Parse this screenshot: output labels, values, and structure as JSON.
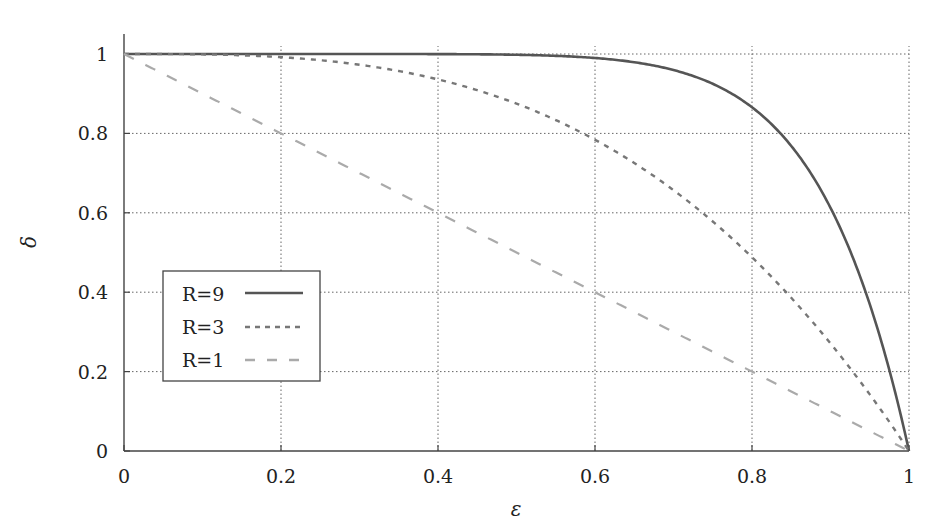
{
  "chart_data": {
    "type": "line",
    "title": "",
    "xlabel": "ε",
    "ylabel": "δ",
    "xlim": [
      0,
      1
    ],
    "ylim": [
      0,
      1
    ],
    "grid": true,
    "legend_position": "inside lower-left",
    "x_ticks": [
      "0",
      "0.2",
      "0.4",
      "0.6",
      "0.8",
      "1"
    ],
    "y_ticks": [
      "0",
      "0.2",
      "0.4",
      "0.6",
      "0.8",
      "1"
    ],
    "x": [
      0,
      0.1,
      0.2,
      0.3,
      0.4,
      0.5,
      0.6,
      0.7,
      0.8,
      0.85,
      0.9,
      0.95,
      1.0
    ],
    "series": [
      {
        "name": "R=9",
        "style": "solid",
        "color": "#555555",
        "values": [
          1.0,
          1.0,
          1.0,
          1.0,
          0.9997,
          0.998,
          0.99,
          0.96,
          0.866,
          0.768,
          0.613,
          0.37,
          0.0
        ]
      },
      {
        "name": "R=3",
        "style": "dotted",
        "color": "#777777",
        "values": [
          1.0,
          0.999,
          0.992,
          0.973,
          0.936,
          0.875,
          0.784,
          0.657,
          0.488,
          0.386,
          0.271,
          0.143,
          0.0
        ]
      },
      {
        "name": "R=1",
        "style": "dashed",
        "color": "#aaaaaa",
        "values": [
          1.0,
          0.9,
          0.8,
          0.7,
          0.6,
          0.5,
          0.4,
          0.3,
          0.2,
          0.15,
          0.1,
          0.05,
          0.0
        ]
      }
    ],
    "formula": "δ = 1 − ε^R"
  },
  "axes": {
    "xlabel": "ε",
    "ylabel": "δ"
  },
  "legend": [
    {
      "label": "R=9"
    },
    {
      "label": "R=3"
    },
    {
      "label": "R=1"
    }
  ]
}
